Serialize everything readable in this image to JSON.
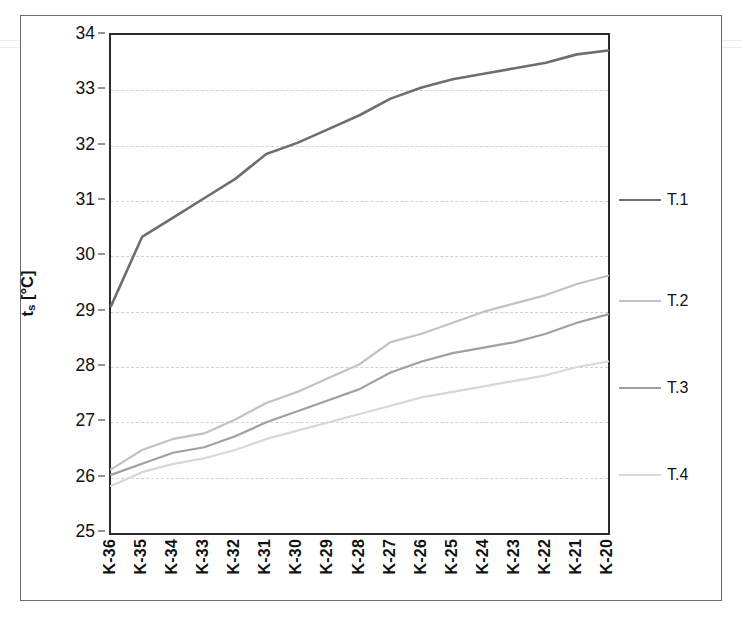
{
  "chart_data": {
    "type": "line",
    "title": "",
    "xlabel": "",
    "ylabel": "t_s [°C]",
    "ylabel_main": "t",
    "ylabel_sub": "s",
    "ylabel_unit": " [°C]",
    "ylim": [
      25,
      34
    ],
    "ytick_step": 1,
    "yticks": [
      25,
      26,
      27,
      28,
      29,
      30,
      31,
      32,
      33,
      34
    ],
    "ytick_labels": [
      "25",
      "26",
      "27",
      "28",
      "29",
      "30",
      "31",
      "32",
      "33",
      "34"
    ],
    "grid": true,
    "grid_style": "dashed-horizontal",
    "grid_color": "#d2d2d2",
    "legend_position": "right",
    "categories": [
      "K-36",
      "K-35",
      "K-34",
      "K-33",
      "K-32",
      "K-31",
      "K-30",
      "K-29",
      "K-28",
      "K-27",
      "K-26",
      "K-25",
      "K-24",
      "K-23",
      "K-22",
      "K-21",
      "K-20"
    ],
    "series": [
      {
        "name": "T.1",
        "color": "#6e6e6e",
        "width": 2.6,
        "values": [
          29.1,
          30.35,
          30.7,
          31.05,
          31.4,
          31.85,
          32.05,
          32.3,
          32.55,
          32.85,
          33.05,
          33.2,
          33.3,
          33.4,
          33.5,
          33.65,
          33.72
        ]
      },
      {
        "name": "T.2",
        "color": "#c2c2c2",
        "width": 2.2,
        "values": [
          26.15,
          26.5,
          26.7,
          26.8,
          27.05,
          27.35,
          27.55,
          27.8,
          28.05,
          28.45,
          28.6,
          28.8,
          29.0,
          29.15,
          29.3,
          29.5,
          29.65
        ]
      },
      {
        "name": "T.3",
        "color": "#a0a0a0",
        "width": 2.2,
        "values": [
          26.05,
          26.25,
          26.45,
          26.55,
          26.75,
          27.0,
          27.2,
          27.4,
          27.6,
          27.9,
          28.1,
          28.25,
          28.35,
          28.45,
          28.6,
          28.8,
          28.95
        ]
      },
      {
        "name": "T.4",
        "color": "#d8d8d8",
        "width": 2.2,
        "values": [
          25.85,
          26.1,
          26.25,
          26.35,
          26.5,
          26.7,
          26.85,
          27.0,
          27.15,
          27.3,
          27.45,
          27.55,
          27.65,
          27.75,
          27.85,
          28.0,
          28.1
        ]
      }
    ]
  },
  "legend": {
    "items": [
      {
        "label": "T.1",
        "color": "#6e6e6e",
        "y": 167
      },
      {
        "label": "T.2",
        "color": "#c2c2c2",
        "y": 268
      },
      {
        "label": "T.3",
        "color": "#a0a0a0",
        "y": 355
      },
      {
        "label": "T.4",
        "color": "#d8d8d8",
        "y": 442
      }
    ]
  }
}
